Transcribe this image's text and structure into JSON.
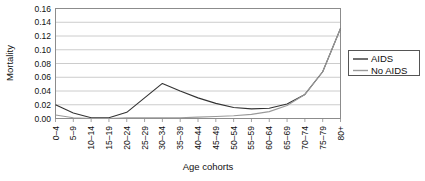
{
  "chart_data": {
    "type": "line",
    "title": "",
    "xlabel": "Age cohorts",
    "ylabel": "Mortality",
    "categories": [
      "0–4",
      "5–9",
      "10–14",
      "15–19",
      "20–24",
      "25–29",
      "30–34",
      "35–39",
      "40–44",
      "45–49",
      "50–54",
      "55–59",
      "60–64",
      "65–69",
      "70–74",
      "75–79",
      "80+"
    ],
    "series": [
      {
        "name": "AIDS",
        "color": "#333333",
        "values": [
          0.02,
          0.008,
          0.001,
          0.001,
          0.009,
          0.03,
          0.051,
          0.04,
          0.03,
          0.022,
          0.016,
          0.014,
          0.015,
          0.021,
          0.035,
          0.068,
          0.131
        ]
      },
      {
        "name": "No AIDS",
        "color": "#9a9a9a",
        "values": [
          0.005,
          0.001,
          0.0,
          0.0,
          0.001,
          0.001,
          0.001,
          0.001,
          0.002,
          0.003,
          0.004,
          0.006,
          0.01,
          0.019,
          0.035,
          0.068,
          0.131
        ]
      }
    ],
    "ylim": [
      0.0,
      0.16
    ],
    "ytick_values": [
      "0.00",
      "0.02",
      "0.04",
      "0.06",
      "0.08",
      "0.10",
      "0.12",
      "0.14",
      "0.16"
    ],
    "grid": true,
    "legend_position": "right",
    "legend": [
      {
        "label": "AIDS",
        "color": "#333333"
      },
      {
        "label": "No AIDS",
        "color": "#9a9a9a"
      }
    ]
  }
}
